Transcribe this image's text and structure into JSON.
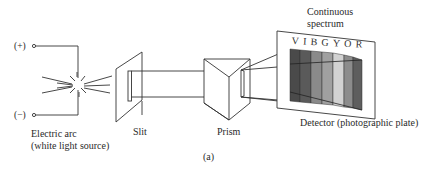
{
  "diagram": {
    "caption": "(a)",
    "terminals": {
      "positive": "(+)",
      "negative": "(−)"
    },
    "labels": {
      "source_line1": "Electric arc",
      "source_line2": "(white light source)",
      "slit": "Slit",
      "prism": "Prism",
      "spectrum_line1": "Continuous",
      "spectrum_line2": "spectrum",
      "detector": "Detector (photographic plate)"
    },
    "spectrum_letters": "VIBGYOR",
    "spectrum_bands": [
      {
        "letter": "V",
        "shade": "#4a4a4a"
      },
      {
        "letter": "I",
        "shade": "#5a5a5a"
      },
      {
        "letter": "B",
        "shade": "#8a8a8a"
      },
      {
        "letter": "G",
        "shade": "#a0a0a0"
      },
      {
        "letter": "Y",
        "shade": "#d2d2d2"
      },
      {
        "letter": "O",
        "shade": "#8c8c8c"
      },
      {
        "letter": "R",
        "shade": "#5e5e5e"
      }
    ],
    "line_color": "#333333"
  }
}
